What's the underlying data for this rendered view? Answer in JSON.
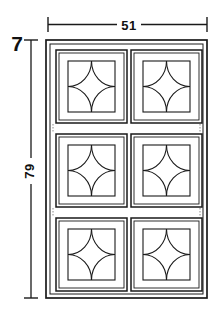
{
  "drawing": {
    "title": "Decorative Panel Grid Elevation",
    "background_color": "#ffffff",
    "line_color": "#1a1a1a",
    "text_color": "#111111",
    "dimensions": {
      "width": {
        "value": "51",
        "label": "51",
        "orientation": "horizontal",
        "position": "top"
      },
      "height": {
        "value": "79",
        "label": "79",
        "orientation": "vertical-rotated",
        "position": "left"
      },
      "callout": {
        "value": "7",
        "label": "7",
        "position": "top-left"
      }
    },
    "panel": {
      "rows": 3,
      "columns": 2,
      "cell_count": 6,
      "motif": "four-corner-quarter-arc-quatrefoil",
      "frame": "double-line-outer-border"
    },
    "cells": [
      {
        "row": 1,
        "column": 1,
        "motif": "quatrefoil"
      },
      {
        "row": 1,
        "column": 2,
        "motif": "quatrefoil"
      },
      {
        "row": 2,
        "column": 1,
        "motif": "quatrefoil"
      },
      {
        "row": 2,
        "column": 2,
        "motif": "quatrefoil"
      },
      {
        "row": 3,
        "column": 1,
        "motif": "quatrefoil"
      },
      {
        "row": 3,
        "column": 2,
        "motif": "quatrefoil"
      }
    ]
  }
}
